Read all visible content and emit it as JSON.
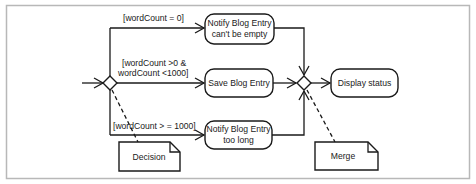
{
  "diagram": {
    "type": "UML activity diagram",
    "decision_note": "Decision",
    "merge_note": "Merge",
    "guards": {
      "top": "[wordCount = 0]",
      "middle_line1": "[wordCount >0 &",
      "middle_line2": "wordCount <1000]",
      "bottom": "[wordCount > = 1000]"
    },
    "actions": {
      "notify_empty_line1": "Notify Blog Entry",
      "notify_empty_line2": "can't be empty",
      "save": "Save Blog Entry",
      "notify_long_line1": "Notify Blog Entry",
      "notify_long_line2": "too long",
      "display": "Display status"
    },
    "colors": {
      "stroke": "#1a1a1a",
      "frame": "#b8b8b8",
      "background": "#ffffff"
    }
  }
}
